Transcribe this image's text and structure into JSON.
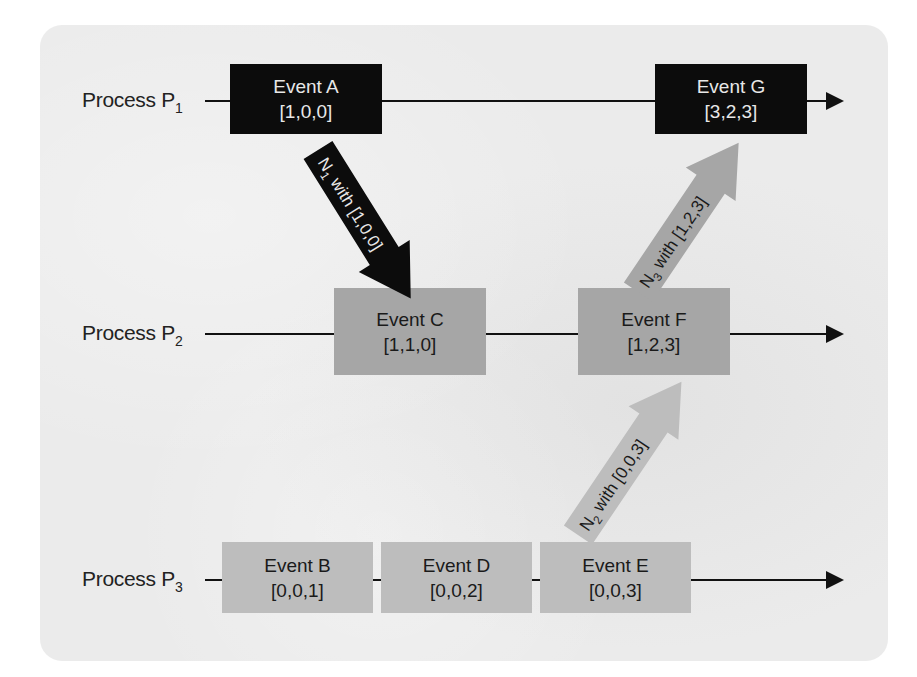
{
  "diagram": {
    "type": "vector-clock-timeline",
    "processes": [
      {
        "id": "P1",
        "label": "Process P",
        "subscript": "1"
      },
      {
        "id": "P2",
        "label": "Process P",
        "subscript": "2"
      },
      {
        "id": "P3",
        "label": "Process P",
        "subscript": "3"
      }
    ],
    "events": {
      "A": {
        "name": "Event A",
        "clock": "[1,0,0]",
        "process": "P1"
      },
      "G": {
        "name": "Event G",
        "clock": "[3,2,3]",
        "process": "P1"
      },
      "C": {
        "name": "Event C",
        "clock": "[1,1,0]",
        "process": "P2"
      },
      "F": {
        "name": "Event F",
        "clock": "[1,2,3]",
        "process": "P2"
      },
      "B": {
        "name": "Event B",
        "clock": "[0,0,1]",
        "process": "P3"
      },
      "D": {
        "name": "Event D",
        "clock": "[0,0,2]",
        "process": "P3"
      },
      "E": {
        "name": "Event E",
        "clock": "[0,0,3]",
        "process": "P3"
      }
    },
    "messages": [
      {
        "id": "N1",
        "prefix": "N",
        "subscript": "1",
        "text": " with [1,0,0]",
        "from": "A",
        "to": "C",
        "color": "#0c0c0c",
        "text_color": "#e8e8e8"
      },
      {
        "id": "N2",
        "prefix": "N",
        "subscript": "2",
        "text": " with [0,0,3]",
        "from": "E",
        "to": "F",
        "color": "#bdbdbd",
        "text_color": "#1a1a1a"
      },
      {
        "id": "N3",
        "prefix": "N",
        "subscript": "3",
        "text": " with [1,2,3]",
        "from": "F",
        "to": "G",
        "color": "#a6a6a6",
        "text_color": "#1a1a1a"
      }
    ],
    "colors": {
      "background_panel": "#ebebeb",
      "dark_event": "#0c0c0c",
      "mid_event": "#a6a6a6",
      "light_event": "#bdbdbd",
      "line": "#111111"
    }
  }
}
